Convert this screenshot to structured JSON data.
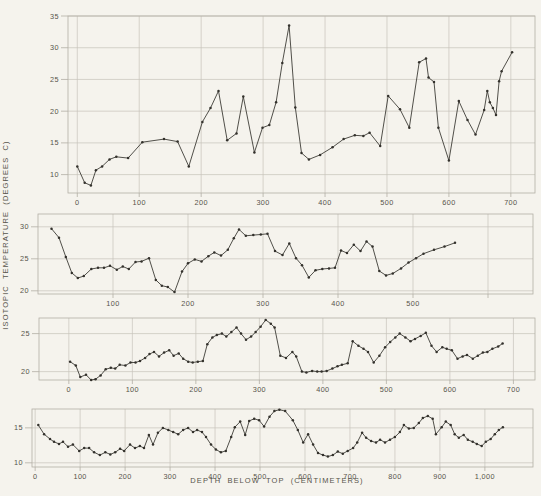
{
  "figure": {
    "y_axis_label": "ISOTOPIC TEMPERATURE (DEGREES C)",
    "x_axis_label": "DEPTH BELOW TOP (CENTIMETERS)"
  },
  "colors": {
    "background": "#f5f3ed",
    "grid": "#c7c3ba",
    "axis": "#b2aea5",
    "line": "#33312c",
    "text": "#57534b"
  },
  "chart_data": [
    {
      "type": "line",
      "panel": "core-1-top",
      "xlabel": "DEPTH BELOW TOP (CENTIMETERS)",
      "ylabel": "ISOTOPIC TEMPERATURE (DEGREES C)",
      "grid": "on",
      "legend": "none",
      "x_range": [
        -15,
        739
      ],
      "y_range": [
        7.1,
        35
      ],
      "x_ticks": [
        0,
        100,
        200,
        300,
        400,
        500,
        600,
        700
      ],
      "x_tick_labels": [
        "0",
        "100",
        "200",
        "300",
        "400",
        "500",
        "600",
        "700"
      ],
      "y_ticks": [
        10,
        15,
        20,
        25,
        30,
        35
      ],
      "points": [
        [
          0,
          11.3
        ],
        [
          12,
          8.7
        ],
        [
          22,
          8.3
        ],
        [
          30,
          10.7
        ],
        [
          40,
          11.3
        ],
        [
          52,
          12.4
        ],
        [
          63,
          12.8
        ],
        [
          82,
          12.6
        ],
        [
          105,
          15.1
        ],
        [
          140,
          15.6
        ],
        [
          162,
          15.2
        ],
        [
          180,
          11.3
        ],
        [
          202,
          18.3
        ],
        [
          215,
          20.5
        ],
        [
          228,
          23.2
        ],
        [
          242,
          15.4
        ],
        [
          257,
          16.5
        ],
        [
          268,
          22.3
        ],
        [
          286,
          13.5
        ],
        [
          299,
          17.4
        ],
        [
          310,
          17.8
        ],
        [
          321,
          21.4
        ],
        [
          331,
          27.6
        ],
        [
          342,
          33.5
        ],
        [
          352,
          20.6
        ],
        [
          362,
          13.4
        ],
        [
          374,
          12.4
        ],
        [
          392,
          13.1
        ],
        [
          412,
          14.3
        ],
        [
          430,
          15.6
        ],
        [
          448,
          16.2
        ],
        [
          462,
          16.1
        ],
        [
          472,
          16.6
        ],
        [
          489,
          14.5
        ],
        [
          502,
          22.4
        ],
        [
          521,
          20.3
        ],
        [
          536,
          17.4
        ],
        [
          552,
          27.7
        ],
        [
          563,
          28.3
        ],
        [
          567,
          25.3
        ],
        [
          576,
          24.6
        ],
        [
          583,
          17.4
        ],
        [
          600,
          12.2
        ],
        [
          616,
          21.6
        ],
        [
          630,
          18.6
        ],
        [
          643,
          16.3
        ],
        [
          657,
          20.2
        ],
        [
          662,
          23.2
        ],
        [
          666,
          21.4
        ],
        [
          671,
          20.5
        ],
        [
          676,
          19.4
        ],
        [
          681,
          24.7
        ],
        [
          685,
          26.3
        ],
        [
          702,
          29.3
        ]
      ]
    },
    {
      "type": "line",
      "panel": "core-2",
      "grid": "on",
      "legend": "none",
      "x_range": [
        0,
        660
      ],
      "y_range": [
        19.5,
        32
      ],
      "x_ticks": [
        100,
        200,
        300,
        400,
        500,
        600
      ],
      "x_tick_labels": [
        "100",
        "200",
        "300",
        "400",
        "500",
        ""
      ],
      "y_ticks": [
        20,
        25,
        30
      ],
      "points": [
        [
          18,
          29.7
        ],
        [
          28,
          28.3
        ],
        [
          37,
          25.3
        ],
        [
          45,
          22.8
        ],
        [
          53,
          22.0
        ],
        [
          61,
          22.3
        ],
        [
          71,
          23.4
        ],
        [
          80,
          23.6
        ],
        [
          88,
          23.6
        ],
        [
          96,
          23.9
        ],
        [
          105,
          23.3
        ],
        [
          113,
          23.8
        ],
        [
          121,
          23.4
        ],
        [
          130,
          24.5
        ],
        [
          138,
          24.6
        ],
        [
          148,
          25.1
        ],
        [
          157,
          21.7
        ],
        [
          165,
          20.8
        ],
        [
          173,
          20.6
        ],
        [
          182,
          19.8
        ],
        [
          192,
          23.0
        ],
        [
          200,
          24.3
        ],
        [
          209,
          24.9
        ],
        [
          218,
          24.6
        ],
        [
          227,
          25.4
        ],
        [
          235,
          26.0
        ],
        [
          244,
          25.5
        ],
        [
          253,
          26.4
        ],
        [
          261,
          28.2
        ],
        [
          268,
          29.6
        ],
        [
          277,
          28.6
        ],
        [
          287,
          28.7
        ],
        [
          297,
          28.8
        ],
        [
          306,
          28.9
        ],
        [
          316,
          26.2
        ],
        [
          326,
          25.6
        ],
        [
          335,
          27.4
        ],
        [
          344,
          25.1
        ],
        [
          352,
          24.0
        ],
        [
          361,
          22.1
        ],
        [
          370,
          23.2
        ],
        [
          379,
          23.4
        ],
        [
          388,
          23.5
        ],
        [
          396,
          23.6
        ],
        [
          404,
          26.3
        ],
        [
          412,
          25.9
        ],
        [
          421,
          27.2
        ],
        [
          430,
          26.2
        ],
        [
          438,
          27.7
        ],
        [
          446,
          26.9
        ],
        [
          455,
          23.1
        ],
        [
          464,
          22.4
        ],
        [
          473,
          22.7
        ],
        [
          484,
          23.5
        ],
        [
          494,
          24.4
        ],
        [
          504,
          25.1
        ],
        [
          514,
          25.8
        ],
        [
          528,
          26.4
        ],
        [
          542,
          26.9
        ],
        [
          556,
          27.5
        ]
      ]
    },
    {
      "type": "line",
      "panel": "core-3",
      "grid": "on",
      "legend": "none",
      "x_range": [
        -47,
        734
      ],
      "y_range": [
        18.9,
        27.05
      ],
      "x_ticks": [
        0,
        100,
        200,
        300,
        400,
        500,
        600,
        700
      ],
      "x_tick_labels": [
        "0",
        "100",
        "200",
        "300",
        "400",
        "500",
        "600",
        "700"
      ],
      "y_ticks": [
        20,
        25
      ],
      "points": [
        [
          2,
          21.3
        ],
        [
          11,
          20.8
        ],
        [
          18,
          19.3
        ],
        [
          27,
          19.6
        ],
        [
          35,
          18.9
        ],
        [
          42,
          19.0
        ],
        [
          50,
          19.5
        ],
        [
          58,
          20.3
        ],
        [
          66,
          20.5
        ],
        [
          73,
          20.4
        ],
        [
          80,
          20.9
        ],
        [
          89,
          20.8
        ],
        [
          97,
          21.2
        ],
        [
          105,
          21.2
        ],
        [
          112,
          21.4
        ],
        [
          120,
          21.8
        ],
        [
          127,
          22.3
        ],
        [
          134,
          22.6
        ],
        [
          142,
          22.0
        ],
        [
          150,
          22.5
        ],
        [
          158,
          22.8
        ],
        [
          165,
          22.1
        ],
        [
          173,
          22.4
        ],
        [
          180,
          21.7
        ],
        [
          188,
          21.3
        ],
        [
          195,
          21.2
        ],
        [
          203,
          21.3
        ],
        [
          211,
          21.4
        ],
        [
          218,
          23.6
        ],
        [
          226,
          24.5
        ],
        [
          233,
          24.8
        ],
        [
          241,
          25.0
        ],
        [
          248,
          24.6
        ],
        [
          256,
          25.2
        ],
        [
          264,
          25.8
        ],
        [
          271,
          25.0
        ],
        [
          279,
          24.2
        ],
        [
          287,
          24.6
        ],
        [
          294,
          25.2
        ],
        [
          302,
          25.9
        ],
        [
          310,
          26.8
        ],
        [
          318,
          26.3
        ],
        [
          324,
          25.8
        ],
        [
          333,
          22.1
        ],
        [
          342,
          21.8
        ],
        [
          352,
          22.6
        ],
        [
          358,
          22.0
        ],
        [
          367,
          20.0
        ],
        [
          374,
          19.9
        ],
        [
          383,
          20.1
        ],
        [
          391,
          20.0
        ],
        [
          398,
          20.0
        ],
        [
          406,
          20.1
        ],
        [
          415,
          20.4
        ],
        [
          423,
          20.7
        ],
        [
          430,
          20.9
        ],
        [
          439,
          21.1
        ],
        [
          447,
          24.0
        ],
        [
          456,
          23.4
        ],
        [
          464,
          23.0
        ],
        [
          471,
          22.6
        ],
        [
          480,
          21.2
        ],
        [
          489,
          22.1
        ],
        [
          498,
          23.2
        ],
        [
          506,
          23.9
        ],
        [
          514,
          24.5
        ],
        [
          521,
          25.0
        ],
        [
          530,
          24.5
        ],
        [
          538,
          24.0
        ],
        [
          545,
          24.3
        ],
        [
          554,
          24.7
        ],
        [
          562,
          25.1
        ],
        [
          571,
          23.4
        ],
        [
          579,
          22.6
        ],
        [
          588,
          23.2
        ],
        [
          595,
          23.0
        ],
        [
          603,
          22.8
        ],
        [
          612,
          21.7
        ],
        [
          620,
          22.0
        ],
        [
          627,
          22.2
        ],
        [
          636,
          21.7
        ],
        [
          644,
          22.1
        ],
        [
          652,
          22.5
        ],
        [
          659,
          22.6
        ],
        [
          667,
          23.0
        ],
        [
          676,
          23.3
        ],
        [
          683,
          23.7
        ]
      ]
    },
    {
      "type": "line",
      "panel": "core-4-bottom",
      "grid": "on",
      "legend": "none",
      "x_range": [
        -7,
        1107
      ],
      "y_range": [
        9.4,
        17.7
      ],
      "x_ticks": [
        0,
        100,
        200,
        300,
        400,
        500,
        600,
        700,
        800,
        900,
        1000
      ],
      "x_tick_labels": [
        "0",
        "100",
        "200",
        "300",
        "400",
        "500",
        "600",
        "700",
        "800",
        "900",
        "1,000"
      ],
      "y_ticks": [
        10,
        15
      ],
      "points": [
        [
          7,
          15.4
        ],
        [
          20,
          14.1
        ],
        [
          33,
          13.4
        ],
        [
          42,
          13.0
        ],
        [
          53,
          12.7
        ],
        [
          62,
          13.0
        ],
        [
          73,
          12.3
        ],
        [
          84,
          12.6
        ],
        [
          98,
          11.7
        ],
        [
          109,
          12.1
        ],
        [
          120,
          12.1
        ],
        [
          131,
          11.5
        ],
        [
          144,
          11.1
        ],
        [
          156,
          11.5
        ],
        [
          167,
          11.2
        ],
        [
          178,
          11.5
        ],
        [
          189,
          12.0
        ],
        [
          198,
          11.7
        ],
        [
          211,
          12.6
        ],
        [
          222,
          12.1
        ],
        [
          233,
          12.4
        ],
        [
          242,
          12.1
        ],
        [
          253,
          14.0
        ],
        [
          262,
          12.6
        ],
        [
          273,
          14.3
        ],
        [
          284,
          15.0
        ],
        [
          296,
          14.7
        ],
        [
          307,
          14.4
        ],
        [
          318,
          14.1
        ],
        [
          329,
          14.7
        ],
        [
          340,
          15.0
        ],
        [
          351,
          14.4
        ],
        [
          360,
          14.7
        ],
        [
          371,
          14.4
        ],
        [
          380,
          13.7
        ],
        [
          391,
          12.6
        ],
        [
          402,
          11.9
        ],
        [
          413,
          11.5
        ],
        [
          424,
          11.7
        ],
        [
          436,
          13.7
        ],
        [
          444,
          15.1
        ],
        [
          456,
          15.9
        ],
        [
          467,
          14.0
        ],
        [
          476,
          16.0
        ],
        [
          487,
          16.3
        ],
        [
          498,
          16.1
        ],
        [
          509,
          15.2
        ],
        [
          521,
          16.6
        ],
        [
          532,
          17.4
        ],
        [
          543,
          17.6
        ],
        [
          556,
          17.4
        ],
        [
          573,
          16.1
        ],
        [
          584,
          14.7
        ],
        [
          596,
          12.9
        ],
        [
          607,
          14.1
        ],
        [
          618,
          12.6
        ],
        [
          629,
          11.4
        ],
        [
          640,
          11.1
        ],
        [
          651,
          10.9
        ],
        [
          662,
          11.1
        ],
        [
          673,
          11.6
        ],
        [
          684,
          11.3
        ],
        [
          695,
          11.7
        ],
        [
          707,
          12.1
        ],
        [
          716,
          12.9
        ],
        [
          727,
          14.3
        ],
        [
          736,
          13.6
        ],
        [
          747,
          13.1
        ],
        [
          758,
          12.9
        ],
        [
          767,
          13.3
        ],
        [
          778,
          12.9
        ],
        [
          789,
          13.3
        ],
        [
          800,
          13.7
        ],
        [
          811,
          14.4
        ],
        [
          820,
          15.4
        ],
        [
          831,
          14.9
        ],
        [
          842,
          15.0
        ],
        [
          853,
          15.7
        ],
        [
          862,
          16.4
        ],
        [
          873,
          16.7
        ],
        [
          884,
          16.3
        ],
        [
          891,
          14.1
        ],
        [
          904,
          15.1
        ],
        [
          913,
          15.9
        ],
        [
          924,
          15.4
        ],
        [
          933,
          14.1
        ],
        [
          942,
          13.6
        ],
        [
          953,
          14.0
        ],
        [
          962,
          13.3
        ],
        [
          973,
          13.0
        ],
        [
          982,
          12.7
        ],
        [
          993,
          12.4
        ],
        [
          1002,
          13.0
        ],
        [
          1013,
          13.4
        ],
        [
          1022,
          14.1
        ],
        [
          1031,
          14.7
        ],
        [
          1040,
          15.1
        ]
      ]
    }
  ]
}
